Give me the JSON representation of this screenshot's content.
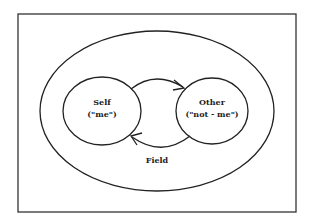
{
  "diagram": {
    "nodes": [
      {
        "id": "self",
        "title": "Self",
        "subtitle": "(\"me\")"
      },
      {
        "id": "other",
        "title": "Other",
        "subtitle": "(\"not - me\")"
      }
    ],
    "field_label": "Field",
    "edges": [
      {
        "from": "self",
        "to": "other",
        "position": "top"
      },
      {
        "from": "other",
        "to": "self",
        "position": "bottom"
      }
    ],
    "colors": {
      "stroke": "#222222",
      "background": "#ffffff"
    }
  }
}
